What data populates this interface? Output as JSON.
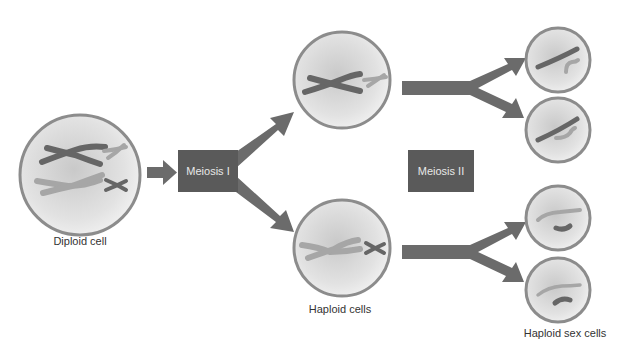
{
  "colors": {
    "arrow": "#6b6b6b",
    "box": "#5a5a5a",
    "cell_border": "#8c8c8c",
    "cell_fill": "#e6e6e6",
    "chromosome_dark": "#666666",
    "chromosome_light": "#a6a6a6"
  },
  "stages": {
    "meiosis1": "Meiosis I",
    "meiosis2": "Meiosis II"
  },
  "labels": {
    "diploid": "Diploid cell",
    "haploid": "Haploid cells",
    "sex_cells": "Haploid sex cells"
  },
  "cells": [
    {
      "id": "diploid",
      "cx": 80,
      "cy": 175,
      "r": 60
    },
    {
      "id": "haploid-top",
      "cx": 342,
      "cy": 80,
      "r": 48
    },
    {
      "id": "haploid-bottom",
      "cx": 342,
      "cy": 248,
      "r": 48
    },
    {
      "id": "sex-cell-1",
      "cx": 558,
      "cy": 60,
      "r": 32
    },
    {
      "id": "sex-cell-2",
      "cx": 558,
      "cy": 130,
      "r": 32
    },
    {
      "id": "sex-cell-3",
      "cx": 558,
      "cy": 218,
      "r": 32
    },
    {
      "id": "sex-cell-4",
      "cx": 558,
      "cy": 290,
      "r": 32
    }
  ]
}
